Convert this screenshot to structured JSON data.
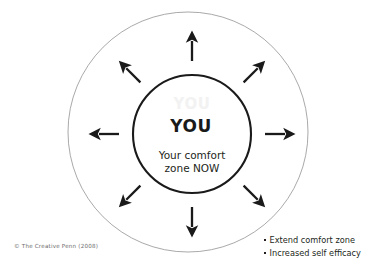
{
  "diagram": {
    "center": {
      "ghost_label": "YOU",
      "primary_label": "YOU",
      "caption_line1": "Your comfort",
      "caption_line2": "zone NOW"
    },
    "credit": "© The Creative Penn (2008)",
    "benefits": [
      {
        "text": "Extend comfort zone"
      },
      {
        "text": "Increased self efficacy"
      }
    ],
    "arrows": [
      {
        "name": "arrow-up",
        "angle": 0,
        "direction": "up"
      },
      {
        "name": "arrow-up-right",
        "angle": 45,
        "direction": "up-right"
      },
      {
        "name": "arrow-right",
        "angle": 90,
        "direction": "right"
      },
      {
        "name": "arrow-down-right",
        "angle": 135,
        "direction": "down-right"
      },
      {
        "name": "arrow-down",
        "angle": 180,
        "direction": "down"
      },
      {
        "name": "arrow-down-left",
        "angle": 225,
        "direction": "down-left"
      },
      {
        "name": "arrow-left",
        "angle": 270,
        "direction": "left"
      },
      {
        "name": "arrow-up-left",
        "angle": 315,
        "direction": "up-left"
      }
    ],
    "colors": {
      "outer_circle_stroke": "#8c8c8c",
      "inner_circle_stroke": "#1a1a1a",
      "arrow_fill": "#1a1a1a",
      "text": "#231f20",
      "ghost_text": "#f2f2f2",
      "credit_text": "#6b6b6b",
      "background": "#ffffff"
    },
    "geometry": {
      "outer_circle": {
        "cx": 188,
        "cy": 132,
        "r": 120
      },
      "inner_circle": {
        "cx": 192,
        "cy": 134,
        "r": 59
      }
    }
  }
}
